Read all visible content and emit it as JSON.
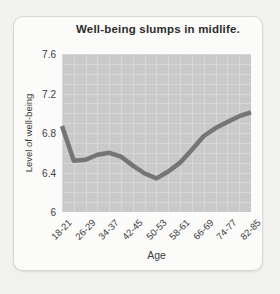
{
  "card": {
    "title": "Well-being slumps in midlife."
  },
  "chart_data": {
    "type": "line",
    "title": "Well-being slumps in midlife.",
    "xlabel": "Age",
    "ylabel": "Level of well-being",
    "ylim": [
      6,
      7.6
    ],
    "grid": true,
    "legend": "none",
    "y_ticks": [
      "7.6",
      "7.2",
      "6.8",
      "6.4",
      "6"
    ],
    "x_tick_labels": [
      "18-21",
      "26-29",
      "34-37",
      "42-45",
      "50-53",
      "58-61",
      "66-69",
      "74-77",
      "82-85"
    ],
    "categories": [
      "18-21",
      "22-25",
      "26-29",
      "30-33",
      "34-37",
      "38-41",
      "42-45",
      "46-49",
      "50-53",
      "54-57",
      "58-61",
      "62-65",
      "66-69",
      "70-73",
      "74-77",
      "78-81",
      "82-85"
    ],
    "values": [
      6.87,
      6.52,
      6.53,
      6.58,
      6.6,
      6.56,
      6.47,
      6.39,
      6.34,
      6.41,
      6.5,
      6.63,
      6.77,
      6.85,
      6.91,
      6.97,
      7.01
    ],
    "colors": {
      "line": "#757575",
      "plot_background": "#c9c9c9",
      "grid_line": "#d7d7d7",
      "card_background": "#fbfbf9",
      "card_border": "#d7d7d4",
      "page_background": "#f1f1ee",
      "text": "#3d3d3d"
    }
  }
}
